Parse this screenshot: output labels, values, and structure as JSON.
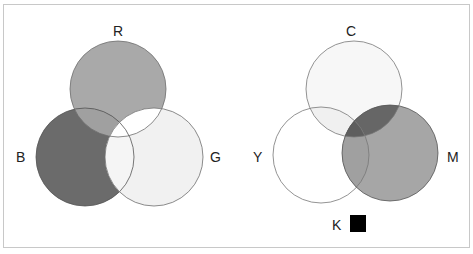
{
  "figure": {
    "frame": {
      "x": 3,
      "y": 4,
      "w": 466,
      "h": 243,
      "stroke": "#c8c8c8"
    },
    "additive": {
      "title": "RGB additive color",
      "circles": [
        {
          "id": "R",
          "label": "R",
          "cx": 118,
          "cy": 89,
          "r": 48,
          "fill": "#a9a9a9"
        },
        {
          "id": "B",
          "label": "B",
          "cx": 85,
          "cy": 157,
          "r": 49,
          "fill": "#6b6b6b"
        },
        {
          "id": "G",
          "label": "G",
          "cx": 154,
          "cy": 157,
          "r": 49,
          "fill": "#f1f1f1"
        }
      ],
      "overlaps": {
        "R_B": "#a0a0a0",
        "R_G": "#ffffff",
        "B_G": "#f5f5f5",
        "RGB": "#ffffff"
      },
      "labels": [
        {
          "text": "R",
          "x": 114,
          "y": 36
        },
        {
          "text": "B",
          "x": 20,
          "y": 162
        },
        {
          "text": "G",
          "x": 214,
          "y": 162
        }
      ]
    },
    "subtractive": {
      "title": "CMYK subtractive color",
      "circles": [
        {
          "id": "C",
          "label": "C",
          "cx": 354,
          "cy": 89,
          "r": 48,
          "fill": "#f7f7f7"
        },
        {
          "id": "Y",
          "label": "Y",
          "cx": 321,
          "cy": 155,
          "r": 48,
          "fill": "#ffffff"
        },
        {
          "id": "M",
          "label": "M",
          "cx": 390,
          "cy": 153,
          "r": 48,
          "fill": "#a6a6a6"
        }
      ],
      "overlaps": {
        "C_Y": "#f0f0f0",
        "C_M": "#666666",
        "Y_M": "#a0a0a0",
        "CMY": "#5e5e5e"
      },
      "labels": [
        {
          "text": "C",
          "x": 350,
          "y": 36
        },
        {
          "text": "Y",
          "x": 257,
          "y": 162
        },
        {
          "text": "M",
          "x": 452,
          "y": 162
        },
        {
          "text": "K",
          "x": 336,
          "y": 230
        }
      ],
      "k_swatch": {
        "x": 350,
        "y": 215,
        "w": 16,
        "h": 17,
        "fill": "#000000"
      }
    }
  }
}
